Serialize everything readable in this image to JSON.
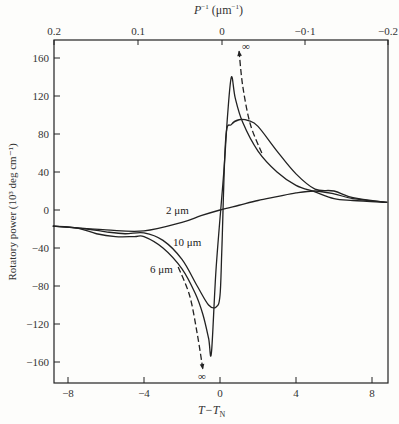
{
  "chart_data": {
    "type": "line",
    "title": "",
    "xlabel": "T−T_N",
    "ylabel": "Rotatory power (10³ deg cm⁻¹)",
    "top_xlabel": "P⁻¹ (μm⁻¹)",
    "xlim": [
      -8.8,
      8.8
    ],
    "ylim": [
      -180,
      180
    ],
    "grid": false,
    "x_ticks": [
      "−8",
      "−4",
      "0",
      "4",
      "8"
    ],
    "x_tick_values": [
      -8,
      -4,
      0,
      4,
      8
    ],
    "top_x_ticks": [
      "0.2",
      "0.1",
      "0",
      "−0·1",
      "−0.2"
    ],
    "top_x_tick_px": [
      54,
      138,
      222,
      305,
      388
    ],
    "y_ticks": [
      "160",
      "120",
      "80",
      "40",
      "0",
      "−40",
      "−80",
      "−120",
      "−160"
    ],
    "y_tick_values": [
      160,
      120,
      80,
      40,
      0,
      -40,
      -80,
      -120,
      -160
    ],
    "series": [
      {
        "name": "2 μm",
        "style": "solid",
        "x": [
          -8.8,
          -6,
          -4,
          -2,
          -1,
          0,
          1,
          2,
          3,
          4,
          5,
          6,
          7,
          8.8
        ],
        "y": [
          -17,
          -21,
          -22,
          -13,
          -6,
          0,
          5,
          10,
          14,
          18,
          20,
          17,
          12,
          8
        ]
      },
      {
        "name": "6 μm",
        "style": "solid",
        "x": [
          -8.8,
          -7.5,
          -6.5,
          -5.5,
          -4.5,
          -4,
          -3,
          -2,
          -1.3,
          -0.9,
          -0.6,
          -0.45,
          -0.2,
          0.2,
          0.4,
          0.6,
          0.8,
          1.2,
          2,
          3,
          4,
          5,
          6,
          7,
          8.8
        ],
        "y": [
          -17,
          -19,
          -25,
          -28,
          -28,
          -28,
          -40,
          -62,
          -88,
          -110,
          -135,
          -150,
          -60,
          40,
          100,
          140,
          118,
          92,
          62,
          40,
          26,
          19,
          12,
          10,
          8
        ]
      },
      {
        "name": "10 μm",
        "style": "solid",
        "x": [
          -8.8,
          -7,
          -6,
          -5,
          -4,
          -3,
          -2,
          -1.2,
          -0.6,
          -0.2,
          0,
          0.1,
          0.3,
          0.6,
          1,
          1.5,
          2,
          3,
          4,
          5,
          6,
          7,
          8.8
        ],
        "y": [
          -17,
          -20,
          -23,
          -25,
          -24,
          -32,
          -52,
          -80,
          -100,
          -102,
          -90,
          -40,
          75,
          90,
          95,
          94,
          88,
          62,
          38,
          22,
          20,
          13,
          8
        ]
      },
      {
        "name": "asymptote-lower",
        "style": "dashed",
        "x": [
          -2.2,
          -1.6,
          -1.2,
          -0.9
        ],
        "y": [
          -60,
          -90,
          -130,
          -168
        ]
      },
      {
        "name": "asymptote-upper",
        "style": "dashed",
        "x": [
          2.2,
          1.6,
          1.2,
          1.0
        ],
        "y": [
          60,
          90,
          130,
          168
        ]
      }
    ],
    "annotations": [
      {
        "text": "2 μm",
        "x": -2.5,
        "y": 4
      },
      {
        "text": "10 μm",
        "x": -3.5,
        "y": -30
      },
      {
        "text": "6 μm",
        "x": -4.5,
        "y": -60
      },
      {
        "text": "∞",
        "x": 1.3,
        "y": 174
      },
      {
        "text": "∞",
        "x": -0.9,
        "y": -174
      }
    ]
  },
  "labels": {
    "series_2um": "2 μm",
    "series_10um": "10 μm",
    "series_6um": "6 μm",
    "infinity_top": "∞",
    "infinity_bottom": "∞",
    "xlabel_main": "T−T",
    "xlabel_sub": "N",
    "top_xlabel_main": "P",
    "top_xlabel_sup": "−1",
    "top_xlabel_unit": "(μm",
    "top_xlabel_unit_sup": "−1",
    "top_xlabel_close": ")",
    "ylabel": "Rotatory power (10³ deg cm⁻¹)"
  }
}
